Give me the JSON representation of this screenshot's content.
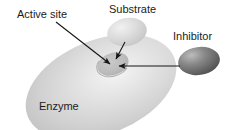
{
  "figure": {
    "background_color": "#ffffff",
    "width": 233,
    "height": 130
  },
  "labels": {
    "active_site": "Active site",
    "substrate": "Substrate",
    "inhibitor": "Inhibitor",
    "enzyme": "Enzyme"
  },
  "shapes": {
    "enzyme": {
      "name": "Enzyme",
      "fill_color": "#d2d2d2",
      "highlight_color": "#f2f2f2",
      "shadow_color": "#b9b9b9",
      "center_x": 101,
      "center_y": 87,
      "radius_x": 79,
      "radius_y": 47,
      "rotation_deg": -22
    },
    "substrate": {
      "name": "Substrate",
      "fill_color": "#d6d6d6",
      "highlight_color": "#f0f0f0",
      "center_x": 127,
      "center_y": 32,
      "radius_x": 20,
      "radius_y": 14,
      "rotation_deg": -12
    },
    "inhibitor": {
      "name": "Inhibitor",
      "fill_color": "#7b7b7b",
      "highlight_color": "#b6b6b6",
      "shadow_color": "#4d4d4d",
      "center_x": 199,
      "center_y": 61,
      "radius_x": 21,
      "radius_y": 14,
      "rotation_deg": -8
    },
    "active_site": {
      "name": "Active site",
      "fill_color": "#bdbdbd",
      "rim_color": "#a8a8a8",
      "center_x": 113,
      "center_y": 64,
      "radius_x": 16,
      "radius_y": 11,
      "rotation_deg": -20
    }
  },
  "arrows": {
    "color": "#171717",
    "items": [
      {
        "name": "active-site-arrow",
        "from_label": "Active site",
        "to_shape": "active_site",
        "x1": 56,
        "y1": 22,
        "x2": 112,
        "y2": 66
      },
      {
        "name": "substrate-arrow",
        "from_label": "Substrate",
        "to_shape": "active_site",
        "x1": 124,
        "y1": 43,
        "x2": 115,
        "y2": 62
      },
      {
        "name": "inhibitor-arrow",
        "from_label": "Inhibitor",
        "to_shape": "active_site",
        "x1": 179,
        "y1": 66,
        "x2": 117,
        "y2": 66
      }
    ]
  }
}
